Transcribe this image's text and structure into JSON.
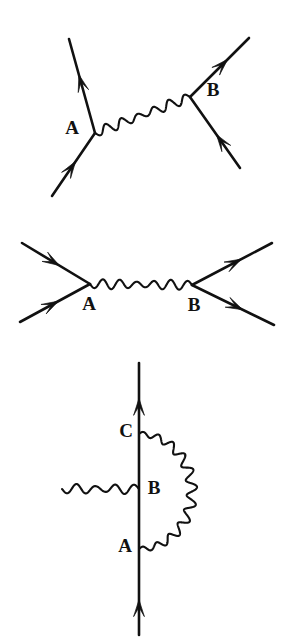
{
  "document": {
    "kind": "feynman-diagram-figure",
    "background_color": "#ffffff",
    "ink_color": "#111111",
    "width": 288,
    "height": 640
  },
  "diagrams": [
    {
      "id": "diagram-1",
      "name": "tree-level-scattering-t-channel",
      "vertices": [
        {
          "label": "A",
          "x": 95,
          "y": 133,
          "label_x": 72,
          "label_y": 130
        },
        {
          "label": "B",
          "x": 190,
          "y": 97,
          "label_x": 213,
          "label_y": 92
        }
      ],
      "fermion_lines": [
        {
          "name": "incoming-left",
          "from": [
            52,
            196
          ],
          "to": [
            95,
            133
          ],
          "arrow_at": 0.55,
          "direction": "up-right"
        },
        {
          "name": "outgoing-left",
          "from": [
            95,
            133
          ],
          "to": [
            69,
            39
          ],
          "arrow_at": 0.62,
          "direction": "up-left"
        },
        {
          "name": "outgoing-right",
          "from": [
            190,
            97
          ],
          "to": [
            249,
            38
          ],
          "arrow_at": 0.64,
          "direction": "up-right"
        },
        {
          "name": "incoming-right",
          "from": [
            240,
            168
          ],
          "to": [
            190,
            97
          ],
          "arrow_at": 0.47,
          "direction": "up-left"
        }
      ],
      "photon_lines": [
        {
          "name": "exchanged-photon",
          "from": [
            95,
            133
          ],
          "to": [
            190,
            97
          ],
          "waves": 6
        }
      ]
    },
    {
      "id": "diagram-2",
      "name": "annihilation-s-channel",
      "vertices": [
        {
          "label": "A",
          "x": 90,
          "y": 284,
          "label_x": 89,
          "label_y": 306
        },
        {
          "label": "B",
          "x": 192,
          "y": 285,
          "label_x": 194,
          "label_y": 307
        }
      ],
      "fermion_lines": [
        {
          "name": "incoming-upper-left",
          "from": [
            22,
            243
          ],
          "to": [
            90,
            284
          ],
          "arrow_at": 0.55,
          "direction": "down-right"
        },
        {
          "name": "incoming-lower-left",
          "from": [
            20,
            322
          ],
          "to": [
            90,
            284
          ],
          "arrow_at": 0.55,
          "direction": "up-right"
        },
        {
          "name": "outgoing-upper-right",
          "from": [
            192,
            285
          ],
          "to": [
            272,
            243
          ],
          "arrow_at": 0.62,
          "direction": "up-right"
        },
        {
          "name": "outgoing-lower-right",
          "from": [
            192,
            285
          ],
          "to": [
            274,
            325
          ],
          "arrow_at": 0.62,
          "direction": "down-right"
        }
      ],
      "photon_lines": [
        {
          "name": "exchanged-photon",
          "from": [
            90,
            284
          ],
          "to": [
            192,
            285
          ],
          "waves": 6
        }
      ]
    },
    {
      "id": "diagram-3",
      "name": "vertex-correction-with-self-energy-loop",
      "vertices": [
        {
          "label": "C",
          "x": 139,
          "y": 434,
          "label_x": 126,
          "label_y": 433
        },
        {
          "label": "B",
          "x": 139,
          "y": 489,
          "label_x": 154,
          "label_y": 490
        },
        {
          "label": "A",
          "x": 139,
          "y": 549,
          "label_x": 125,
          "label_y": 548
        }
      ],
      "fermion_lines": [
        {
          "name": "vertical-fermion-line",
          "from": [
            139,
            635
          ],
          "to": [
            139,
            363
          ],
          "arrows_at": [
            0.87,
            0.13
          ],
          "direction": "up"
        }
      ],
      "photon_lines": [
        {
          "name": "incoming-external-photon",
          "from": [
            62,
            489
          ],
          "to": [
            139,
            489
          ],
          "waves": 4
        },
        {
          "name": "photon-loop-arc",
          "from": [
            139,
            434
          ],
          "to": [
            139,
            549
          ],
          "bulge_x": 192,
          "waves": 11
        }
      ]
    }
  ],
  "labels": {
    "vertex_a": "A",
    "vertex_b": "B",
    "vertex_c": "C"
  }
}
